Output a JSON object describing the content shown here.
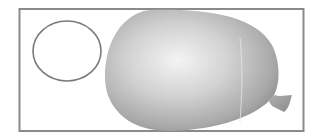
{
  "scene": {
    "description": "Frame containing an outlined ellipse and a shaded balloon",
    "colors": {
      "frame": "#8a8a8a",
      "ellipse_stroke": "#7a7a7a",
      "balloon_light": "#f2f2f2",
      "balloon_mid": "#bdbdbd",
      "balloon_dark": "#8c8c8c",
      "background": "#ffffff"
    },
    "objects": [
      "frame",
      "ellipse",
      "balloon",
      "balloon-knot"
    ]
  }
}
